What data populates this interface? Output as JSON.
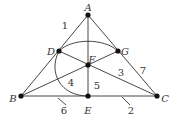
{
  "diagram": {
    "points": [
      {
        "id": "A",
        "label": "A",
        "x": 88,
        "y": 15,
        "lx": 88,
        "ly": 8
      },
      {
        "id": "D",
        "label": "D",
        "x": 59,
        "y": 51,
        "lx": 51,
        "ly": 52
      },
      {
        "id": "G",
        "label": "G",
        "x": 118,
        "y": 51,
        "lx": 125,
        "ly": 52
      },
      {
        "id": "F",
        "label": "F",
        "x": 88,
        "y": 65,
        "lx": 92,
        "ly": 60
      },
      {
        "id": "B",
        "label": "B",
        "x": 21,
        "y": 96,
        "lx": 13,
        "ly": 99
      },
      {
        "id": "E",
        "label": "E",
        "x": 88,
        "y": 96,
        "lx": 88,
        "ly": 111
      },
      {
        "id": "C",
        "label": "C",
        "x": 157,
        "y": 96,
        "lx": 165,
        "ly": 99
      }
    ],
    "line_labels": [
      {
        "label": "1",
        "x": 65,
        "y": 26
      },
      {
        "label": "7",
        "x": 143,
        "y": 71
      },
      {
        "label": "3",
        "x": 121,
        "y": 73
      },
      {
        "label": "4",
        "x": 71,
        "y": 83
      },
      {
        "label": "5",
        "x": 97,
        "y": 86
      },
      {
        "label": "6",
        "x": 64,
        "y": 111
      },
      {
        "label": "2",
        "x": 131,
        "y": 111
      }
    ],
    "colors": {
      "stroke": "#333333",
      "point": "#111111"
    }
  }
}
